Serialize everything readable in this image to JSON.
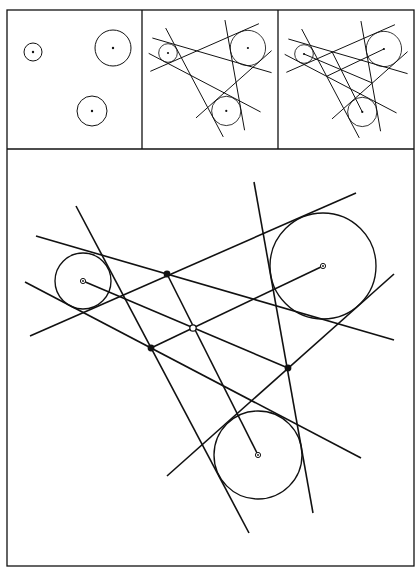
{
  "colors": {
    "background": "#ffffff",
    "stroke": "#111111"
  },
  "frame": {
    "outer": {
      "x": 7,
      "y": 10,
      "w": 407,
      "h": 556
    },
    "top_row_bottom_y": 149,
    "panel_dividers_x": [
      142,
      278
    ]
  },
  "main_figure": {
    "circles": [
      {
        "name": "left-circle",
        "cx": 83,
        "cy": 281,
        "r": 28
      },
      {
        "name": "right-circle",
        "cx": 323,
        "cy": 266,
        "r": 53
      },
      {
        "name": "bottom-circle",
        "cx": 258,
        "cy": 455,
        "r": 44
      }
    ],
    "tangent_lines": [
      {
        "name": "tangent-line-1",
        "x1": 30,
        "y1": 336,
        "x2": 356,
        "y2": 193
      },
      {
        "name": "tangent-line-2",
        "x1": 36,
        "y1": 236,
        "x2": 394,
        "y2": 340
      },
      {
        "name": "tangent-line-3",
        "x1": 25,
        "y1": 282,
        "x2": 361,
        "y2": 458
      },
      {
        "name": "tangent-line-4",
        "x1": 76,
        "y1": 206,
        "x2": 249,
        "y2": 533
      },
      {
        "name": "tangent-line-5",
        "x1": 254,
        "y1": 182,
        "x2": 313,
        "y2": 513
      },
      {
        "name": "tangent-line-6",
        "x1": 167,
        "y1": 476,
        "x2": 394,
        "y2": 274
      }
    ],
    "connector_lines": [
      {
        "name": "connector-left-center-to-c",
        "x1": 83,
        "y1": 281,
        "x2": 288,
        "y2": 368
      },
      {
        "name": "connector-bottom-center-to-a",
        "x1": 258,
        "y1": 455,
        "x2": 167,
        "y2": 274
      },
      {
        "name": "connector-right-center-to-b",
        "x1": 323,
        "y1": 266,
        "x2": 151,
        "y2": 348
      }
    ],
    "intersection_points": [
      {
        "name": "point-a",
        "x": 167,
        "y": 274
      },
      {
        "name": "point-b",
        "x": 151,
        "y": 348
      },
      {
        "name": "point-c",
        "x": 288,
        "y": 368
      }
    ],
    "concurrency_point": {
      "name": "open-point",
      "x": 193,
      "y": 328
    }
  },
  "panels": [
    {
      "name": "panel-circles-only",
      "offset_x": 0,
      "show_lines": false,
      "show_connectors": false,
      "circles": [
        {
          "cx": 33,
          "cy": 52,
          "r": 9
        },
        {
          "cx": 113,
          "cy": 48,
          "r": 18
        },
        {
          "cx": 92,
          "cy": 111,
          "r": 15
        }
      ]
    },
    {
      "name": "panel-tangents",
      "show_lines": true,
      "show_connectors": false,
      "transform": {
        "ox": 83,
        "oy": 281,
        "tx": 168,
        "ty": 53,
        "scale": 0.333
      }
    },
    {
      "name": "panel-tangents-connectors",
      "show_lines": true,
      "show_connectors": true,
      "transform": {
        "ox": 83,
        "oy": 281,
        "tx": 304,
        "ty": 54,
        "scale": 0.333
      }
    }
  ]
}
